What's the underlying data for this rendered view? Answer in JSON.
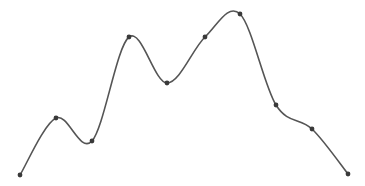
{
  "chart_data": {
    "type": "line",
    "title": "",
    "xlabel": "",
    "ylabel": "",
    "grid": false,
    "legend": null,
    "smooth": true,
    "x": [
      0,
      1,
      2,
      3,
      4,
      5,
      6,
      7,
      8,
      9
    ],
    "series": [
      {
        "name": "curve",
        "values": [
          0,
          57,
          34,
          138,
          92,
          138,
          161,
          70,
          46,
          1
        ]
      }
    ],
    "pixel_points": [
      [
        20,
        175
      ],
      [
        56,
        118
      ],
      [
        92,
        141
      ],
      [
        129,
        37
      ],
      [
        167,
        83
      ],
      [
        205,
        37
      ],
      [
        240,
        14
      ],
      [
        276,
        105
      ],
      [
        312,
        129
      ],
      [
        348,
        174
      ]
    ],
    "style": {
      "line_color": "#555555",
      "marker_color": "#3a3a3a",
      "background": "#ffffff"
    }
  }
}
